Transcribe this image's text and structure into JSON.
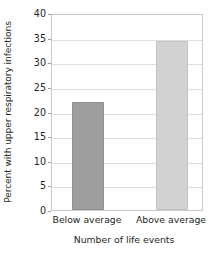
{
  "chart_data": {
    "type": "bar",
    "title": "",
    "categories": [
      "Below average",
      "Above average"
    ],
    "values": [
      22.0,
      34.3
    ],
    "xlabel": "Number of life events",
    "ylabel": "Percent with upper respiratory infections",
    "ylim": [
      0,
      40
    ],
    "yticks": [
      0,
      5,
      10,
      15,
      20,
      25,
      30,
      35,
      40
    ],
    "ytick_labels": [
      "0",
      "5",
      "10",
      "15",
      "20",
      "25",
      "30",
      "35",
      "40"
    ],
    "grid": true,
    "legend": null,
    "bar_colors": [
      "#9e9e9e",
      "#d2d2d2"
    ],
    "bar_edge_colors": [
      "#8f8f8f",
      "#c2c2c2"
    ],
    "background": "#ffffff",
    "grid_color": "#dedede",
    "frame_color": "#c9c9c9",
    "text_color": "#231f20"
  }
}
